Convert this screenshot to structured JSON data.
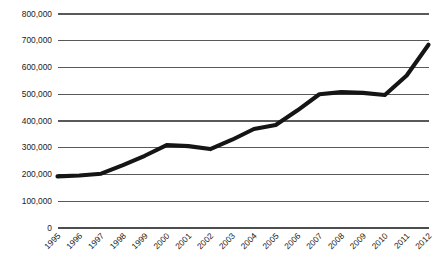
{
  "chart_data": {
    "type": "line",
    "title": "",
    "subtitle": "",
    "xlabel": "",
    "ylabel": "",
    "grid": true,
    "legend": false,
    "legend_position": "none",
    "line_color": "#151515",
    "gridline_color": "#595959",
    "categories": [
      "1995",
      "1996",
      "1997",
      "1998",
      "1999",
      "2000",
      "2001",
      "2002",
      "2003",
      "2004",
      "2005",
      "2006",
      "2007",
      "2008",
      "2009",
      "2010",
      "2011",
      "2012"
    ],
    "values": [
      193000,
      196000,
      203000,
      235000,
      270000,
      310000,
      306000,
      295000,
      330000,
      370000,
      385000,
      440000,
      500000,
      508000,
      505000,
      497000,
      570000,
      685000
    ],
    "ytick_labels": [
      "800,000",
      "700,000",
      "600,000",
      "500,000",
      "400,000",
      "300,000",
      "200,000",
      "100,000",
      "0"
    ],
    "ytick_values": [
      800000,
      700000,
      600000,
      500000,
      400000,
      300000,
      200000,
      100000,
      0
    ],
    "ylim": [
      0,
      800000
    ],
    "ytick_step": 100000,
    "xlim_labels": [
      "1995",
      "2012"
    ],
    "xtick_rotation_degrees": -45
  }
}
